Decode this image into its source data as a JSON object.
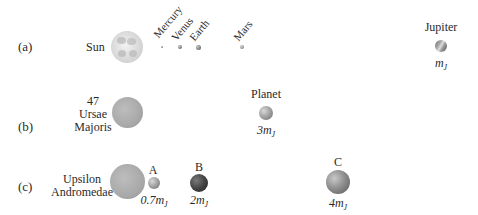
{
  "rows": {
    "a": {
      "label": "(a)",
      "star": {
        "name": "Sun"
      },
      "planets": [
        {
          "name": "Mercury"
        },
        {
          "name": "Venus"
        },
        {
          "name": "Earth"
        },
        {
          "name": "Mars"
        },
        {
          "name": "Jupiter",
          "mass_coef": "",
          "mass_symbol": "m",
          "mass_sub": "J"
        }
      ]
    },
    "b": {
      "label": "(b)",
      "star": {
        "name_lines": [
          "47",
          "Ursae",
          "Majoris"
        ]
      },
      "planets": [
        {
          "name": "Planet",
          "mass_coef": "3",
          "mass_symbol": "m",
          "mass_sub": "J"
        }
      ]
    },
    "c": {
      "label": "(c)",
      "star": {
        "name_lines": [
          "Upsilon",
          "Andromedae"
        ]
      },
      "planets": [
        {
          "name": "A",
          "mass_coef": "0.7",
          "mass_symbol": "m",
          "mass_sub": "J"
        },
        {
          "name": "B",
          "mass_coef": "2",
          "mass_symbol": "m",
          "mass_sub": "J"
        },
        {
          "name": "C",
          "mass_coef": "4",
          "mass_symbol": "m",
          "mass_sub": "J"
        }
      ]
    }
  }
}
